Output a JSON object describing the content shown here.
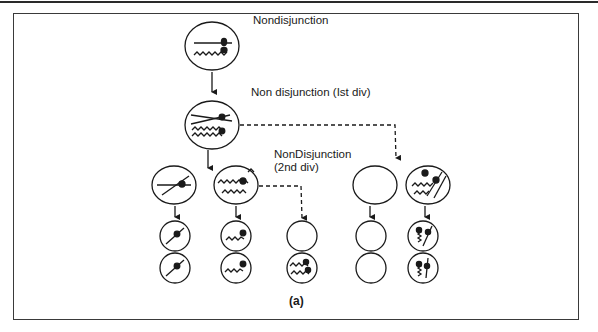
{
  "figure": {
    "caption": "(a)",
    "title": "Nondisjunction",
    "labels": {
      "first_division": "Non disjunction (Ist div)",
      "second_division_line1": "NonDisjunction",
      "second_division_line2": "(2nd div)"
    },
    "stages": [
      {
        "name": "parent-cell",
        "contents": "homologous pair (straight + wavy chromosome)"
      },
      {
        "name": "meiosis-1-cell",
        "contents": "duplicated chromosomes, nondisjunction in 1st division"
      },
      {
        "name": "meiosis-2-cells",
        "cells": [
          {
            "id": "m2-a",
            "contents": "straight chromatid pair"
          },
          {
            "id": "m2-b",
            "contents": "wavy chromatid pair"
          },
          {
            "id": "m2-c",
            "contents": "empty"
          },
          {
            "id": "m2-d",
            "contents": "straight + wavy pairs"
          }
        ]
      },
      {
        "name": "gametes",
        "cells": [
          {
            "id": "g1",
            "contents": "straight"
          },
          {
            "id": "g2",
            "contents": "straight"
          },
          {
            "id": "g3",
            "contents": "wavy"
          },
          {
            "id": "g4",
            "contents": "wavy"
          },
          {
            "id": "g5",
            "contents": "empty"
          },
          {
            "id": "g6",
            "contents": "two wavy"
          },
          {
            "id": "g7",
            "contents": "empty"
          },
          {
            "id": "g8",
            "contents": "empty"
          },
          {
            "id": "g9",
            "contents": "straight + wavy"
          },
          {
            "id": "g10",
            "contents": "straight + wavy"
          }
        ]
      }
    ],
    "colors": {
      "stroke": "#1a1a1a",
      "background": "#ffffff"
    }
  }
}
